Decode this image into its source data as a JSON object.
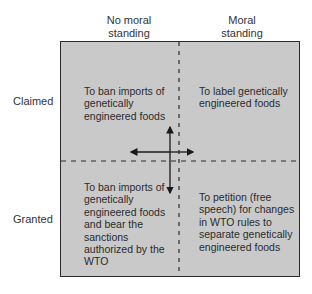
{
  "columns": [
    {
      "label_line1": "No moral",
      "label_line2": "standing"
    },
    {
      "label_line1": "Moral",
      "label_line2": "standing"
    }
  ],
  "rows": [
    {
      "label": "Claimed"
    },
    {
      "label": "Granted"
    }
  ],
  "cells": {
    "claimed_no_moral": "To ban imports of genetically engineered foods",
    "claimed_moral": "To label genetically engineered foods",
    "granted_no_moral": "To ban imports of genetically engineered foods and bear the sanctions authorized by the WTO",
    "granted_moral": "To petition (free speech) for changes in WTO rules to separate genetically engineered foods"
  },
  "colors": {
    "box_fill": "#c9c9c9",
    "line": "#2a2a2a"
  }
}
